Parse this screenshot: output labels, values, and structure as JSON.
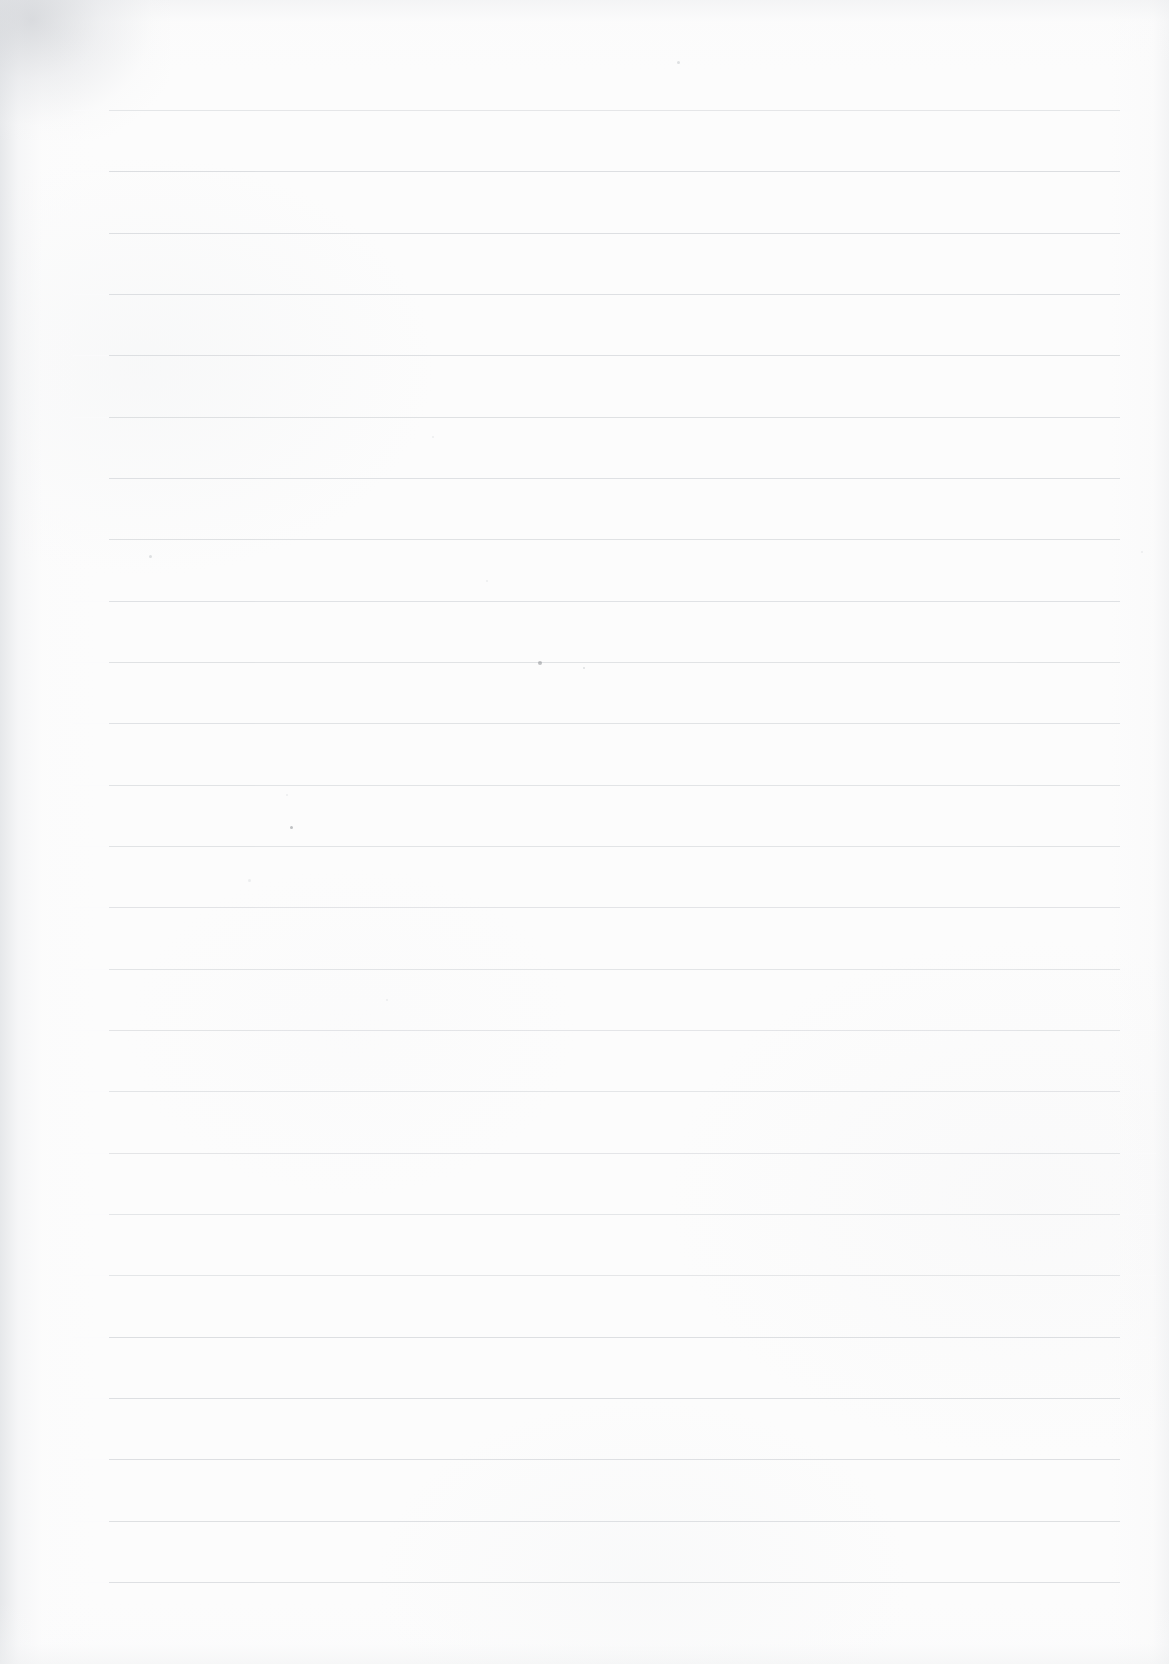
{
  "document": {
    "kind": "blank-lined-notebook-page",
    "title": "Blank lined notebook page",
    "body_text": "",
    "visible_text_count": 0,
    "orientation": "portrait"
  },
  "page": {
    "width": 1169,
    "height": 1664,
    "background_color": "#fcfcfc",
    "paper_tone": "#fdfdfd"
  },
  "ruling": {
    "line_color": "#dcdee1",
    "line_thickness": 1,
    "line_start_x": 73,
    "line_end_x": 1156,
    "first_line_y": 110,
    "line_spacing": 61.3,
    "line_count": 25,
    "lines_y": [
      110,
      171,
      233,
      294,
      355,
      417,
      478,
      539,
      601,
      662,
      723,
      785,
      846,
      907,
      969,
      1030,
      1091,
      1153,
      1214,
      1275,
      1337,
      1398,
      1459,
      1521,
      1582
    ]
  },
  "scan_artifacts": {
    "left_edge_shadow_color": "#e2e4e7",
    "top_left_smudge_color": "#c4c7cc",
    "right_edge_shadow_color": "#ecedef",
    "bottom_edge_shadow_color": "#f0f1f2",
    "specks": [
      {
        "x": 540,
        "y": 663,
        "size": 4,
        "tone": "dark"
      },
      {
        "x": 584,
        "y": 668,
        "size": 2.5,
        "tone": "faint"
      },
      {
        "x": 291,
        "y": 827,
        "size": 3,
        "tone": "dark"
      },
      {
        "x": 150,
        "y": 556,
        "size": 3,
        "tone": "faint"
      },
      {
        "x": 678,
        "y": 62,
        "size": 3,
        "tone": "faint"
      },
      {
        "x": 433,
        "y": 437,
        "size": 2.5,
        "tone": "vfaint"
      },
      {
        "x": 487,
        "y": 581,
        "size": 2.5,
        "tone": "vfaint"
      },
      {
        "x": 249,
        "y": 880,
        "size": 3,
        "tone": "vfaint"
      },
      {
        "x": 387,
        "y": 1000,
        "size": 2.5,
        "tone": "vfaint"
      },
      {
        "x": 1142,
        "y": 552,
        "size": 2.5,
        "tone": "vfaint"
      },
      {
        "x": 287,
        "y": 795,
        "size": 2,
        "tone": "vfaint"
      }
    ]
  }
}
